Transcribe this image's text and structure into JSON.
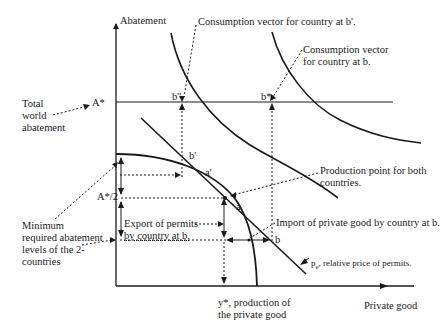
{
  "diagram": {
    "axes": {
      "y_label": "Abatement",
      "x_label": "Private good"
    },
    "levels": {
      "a_star": "A*",
      "a_star_half": "A*/2"
    },
    "points": {
      "b_double_prime": "b''",
      "b_star": "b*",
      "b_prime": "b'",
      "a_prime": "a'",
      "a": "a",
      "b": "b"
    },
    "annotations": {
      "total_world_abatement": [
        "Total",
        "world",
        "abatement"
      ],
      "consumption_b_prime": "Consumption vector for country at b'.",
      "consumption_b": [
        "Consumption vector",
        "for country at b."
      ],
      "production_point": [
        "Production point for both",
        "countries."
      ],
      "import_private_good": "Import of private good by country at b.",
      "export_permits": [
        "Export of permits",
        "by country at b."
      ],
      "minimum_required": [
        "Minimum",
        "required abatement",
        "levels of the 2-",
        "countries"
      ],
      "relative_price_symbol": "p",
      "relative_price_sub": "e",
      "relative_price_text": ", relative price of permits.",
      "y_star": [
        "y*, production of",
        "the private good"
      ]
    }
  }
}
